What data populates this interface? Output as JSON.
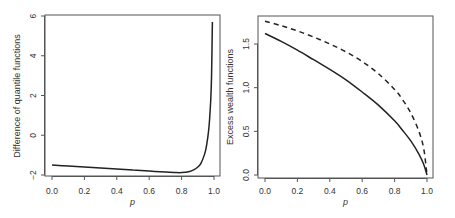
{
  "chart_data": [
    {
      "type": "line",
      "title": "",
      "xlabel": "p",
      "ylabel": "Difference of quantile functions",
      "xlim": [
        0.0,
        1.0
      ],
      "ylim": [
        -2,
        6
      ],
      "xticks": [
        "0.0",
        "0.2",
        "0.4",
        "0.6",
        "0.8",
        "1.0"
      ],
      "yticks": [
        "-2",
        "0",
        "2",
        "4",
        "6"
      ],
      "grid": false,
      "legend": null,
      "series": [
        {
          "name": "difference",
          "style": "solid",
          "x": [
            0.0,
            0.1,
            0.2,
            0.3,
            0.4,
            0.5,
            0.6,
            0.7,
            0.75,
            0.8,
            0.85,
            0.88,
            0.9,
            0.92,
            0.94,
            0.95,
            0.96,
            0.97,
            0.98,
            0.985,
            0.99
          ],
          "values": [
            -1.5,
            -1.55,
            -1.6,
            -1.65,
            -1.7,
            -1.75,
            -1.8,
            -1.85,
            -1.87,
            -1.88,
            -1.82,
            -1.72,
            -1.6,
            -1.4,
            -1.0,
            -0.7,
            -0.2,
            0.5,
            1.8,
            3.0,
            5.7
          ]
        }
      ]
    },
    {
      "type": "line",
      "title": "",
      "xlabel": "p",
      "ylabel": "Excess wealth functions",
      "xlim": [
        0.0,
        1.0
      ],
      "ylim": [
        0.0,
        1.75
      ],
      "xticks": [
        "0.0",
        "0.2",
        "0.4",
        "0.6",
        "0.8",
        "1.0"
      ],
      "yticks": [
        "0.0",
        "0.5",
        "1.0",
        "1.5"
      ],
      "grid": false,
      "legend": null,
      "series": [
        {
          "name": "solid",
          "style": "solid",
          "x": [
            0.0,
            0.1,
            0.2,
            0.3,
            0.4,
            0.5,
            0.6,
            0.7,
            0.8,
            0.85,
            0.9,
            0.95,
            0.98,
            1.0
          ],
          "values": [
            1.62,
            1.53,
            1.43,
            1.32,
            1.21,
            1.09,
            0.95,
            0.8,
            0.62,
            0.51,
            0.39,
            0.24,
            0.12,
            0.0
          ]
        },
        {
          "name": "dashed",
          "style": "dashed",
          "x": [
            0.0,
            0.1,
            0.2,
            0.3,
            0.4,
            0.5,
            0.6,
            0.7,
            0.8,
            0.85,
            0.9,
            0.95,
            0.98,
            1.0
          ],
          "values": [
            1.76,
            1.71,
            1.65,
            1.58,
            1.5,
            1.41,
            1.3,
            1.16,
            0.98,
            0.86,
            0.71,
            0.5,
            0.3,
            0.0
          ]
        }
      ]
    }
  ]
}
